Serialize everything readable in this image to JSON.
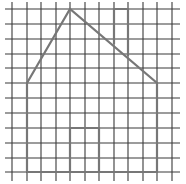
{
  "diagram": {
    "type": "grid-drawing",
    "colors": {
      "background": "#ffffff",
      "grid_line": "#3a3a3a",
      "shape_line": "#777777"
    },
    "grid": {
      "vertical_lines_x": [
        12,
        27,
        41,
        56,
        70,
        85,
        99,
        114,
        128,
        143,
        157,
        172
      ],
      "horizontal_lines_y": [
        9,
        24,
        39,
        54,
        68,
        83,
        98,
        113,
        128,
        143,
        158,
        172
      ],
      "x_extent": [
        5,
        180
      ],
      "y_extent": [
        2,
        181
      ]
    },
    "house": {
      "outline_points": [
        [
          27,
          172
        ],
        [
          27,
          83
        ],
        [
          70,
          9
        ],
        [
          157,
          83
        ],
        [
          157,
          172
        ],
        [
          27,
          172
        ]
      ],
      "chimney_points": [
        [
          114,
          44
        ],
        [
          114,
          9
        ],
        [
          128,
          9
        ],
        [
          128,
          56
        ]
      ],
      "door_points": [
        [
          70,
          172
        ],
        [
          70,
          128
        ],
        [
          99,
          128
        ],
        [
          99,
          172
        ]
      ]
    }
  }
}
